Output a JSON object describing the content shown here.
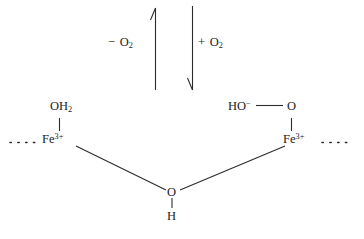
{
  "diagram": {
    "background_color": "#ffffff",
    "stroke_color": "#2b2b2b",
    "text_color": "#1c1c1c",
    "equilibrium": {
      "left_arrow": {
        "name": "minus-o2-arrow",
        "direction": "up",
        "label_operator": "−",
        "label_species": "O",
        "label_subscript": "2",
        "label_full": "− O2",
        "x": 155,
        "y_top": 8,
        "y_bottom": 90
      },
      "right_arrow": {
        "name": "plus-o2-arrow",
        "direction": "down",
        "label_operator": "+",
        "label_species": "O",
        "label_subscript": "2",
        "label_full": "+ O2",
        "x": 192,
        "y_top": 6,
        "y_bottom": 90
      }
    },
    "left_center": {
      "ligand_axial": {
        "formula": "OH",
        "subscript": "2",
        "full": "OH2"
      },
      "metal": {
        "symbol": "Fe",
        "charge": "3+",
        "full": "Fe3+"
      },
      "continuation": "· · · · ·"
    },
    "right_center": {
      "ligand_axial": {
        "hydroxide": "HO",
        "hydroxide_charge": "−",
        "bond": "——",
        "oxygen": "O",
        "full": "HO− — O"
      },
      "metal": {
        "symbol": "Fe",
        "charge": "3+",
        "full": "Fe3+"
      },
      "continuation": "· · · · ·"
    },
    "bridge": {
      "oxygen": "O",
      "hydrogen": "H",
      "full": "OH bridge"
    }
  }
}
